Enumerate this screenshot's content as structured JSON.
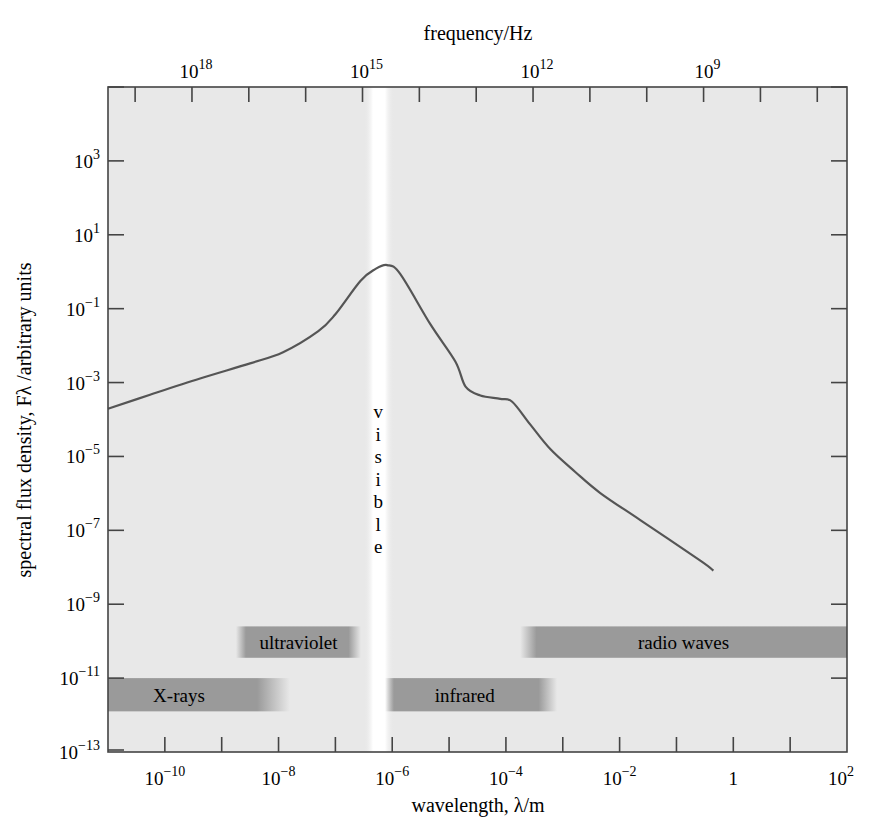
{
  "chart_data": {
    "type": "line",
    "title": "",
    "xlabel": "wavelength, λ/m",
    "ylabel": "spectral flux density, Fλ /arbitrary units",
    "top_xlabel": "frequency/Hz",
    "x_scale": "log",
    "y_scale": "log",
    "xlim_log10": [
      -11,
      2
    ],
    "ylim_log10": [
      -13,
      5
    ],
    "grid": false,
    "legend": null,
    "x_ticks": [
      {
        "log": -10,
        "label": "10",
        "exp": "−10"
      },
      {
        "log": -8,
        "label": "10",
        "exp": "−8"
      },
      {
        "log": -6,
        "label": "10",
        "exp": "−6"
      },
      {
        "log": -4,
        "label": "10",
        "exp": "−4"
      },
      {
        "log": -2,
        "label": "10",
        "exp": "−2"
      },
      {
        "log": 0,
        "label": "1",
        "exp": ""
      },
      {
        "log": 2,
        "label": "10",
        "exp": "2"
      }
    ],
    "y_ticks": [
      {
        "log": 3,
        "label": "10",
        "exp": "3"
      },
      {
        "log": 1,
        "label": "10",
        "exp": "1"
      },
      {
        "log": -1,
        "label": "10",
        "exp": "−1"
      },
      {
        "log": -3,
        "label": "10",
        "exp": "−3"
      },
      {
        "log": -5,
        "label": "10",
        "exp": "−5"
      },
      {
        "log": -7,
        "label": "10",
        "exp": "−7"
      },
      {
        "log": -9,
        "label": "10",
        "exp": "−9"
      },
      {
        "log": -11,
        "label": "10",
        "exp": "−11"
      },
      {
        "log": -13,
        "label": "10",
        "exp": "−13"
      }
    ],
    "freq_ticks": [
      {
        "log_hz": 18,
        "label": "10",
        "exp": "18"
      },
      {
        "log_hz": 15,
        "label": "10",
        "exp": "15"
      },
      {
        "log_hz": 12,
        "label": "10",
        "exp": "12"
      },
      {
        "log_hz": 9,
        "label": "10",
        "exp": "9"
      }
    ],
    "series": [
      {
        "name": "spectrum",
        "color": "#555555",
        "points_log10": [
          [
            -11.0,
            -3.71
          ],
          [
            -10.26,
            -3.33
          ],
          [
            -9.38,
            -2.89
          ],
          [
            -8.5,
            -2.48
          ],
          [
            -7.92,
            -2.18
          ],
          [
            -7.3,
            -1.61
          ],
          [
            -7.0,
            -1.15
          ],
          [
            -6.56,
            -0.25
          ],
          [
            -6.3,
            0.07
          ],
          [
            -6.09,
            0.18
          ],
          [
            -5.86,
            -0.06
          ],
          [
            -5.33,
            -1.42
          ],
          [
            -4.89,
            -2.43
          ],
          [
            -4.71,
            -3.11
          ],
          [
            -4.45,
            -3.35
          ],
          [
            -4.1,
            -3.44
          ],
          [
            -3.89,
            -3.52
          ],
          [
            -3.57,
            -4.14
          ],
          [
            -3.22,
            -4.8
          ],
          [
            -2.78,
            -5.42
          ],
          [
            -2.34,
            -5.99
          ],
          [
            -1.63,
            -6.73
          ],
          [
            -0.58,
            -7.82
          ],
          [
            -0.35,
            -8.09
          ]
        ]
      }
    ],
    "annotations": {
      "visible_band": {
        "label": "visible",
        "center_log10": -6.3
      },
      "bands": [
        {
          "label": "ultraviolet",
          "from_log10": -8.75,
          "to_log10": -6.55,
          "y_top_log10": -9.6,
          "y_bot_log10": -10.45
        },
        {
          "label": "radio waves",
          "from_log10": -3.75,
          "to_log10": 2,
          "y_top_log10": -9.6,
          "y_bot_log10": -10.45
        },
        {
          "label": "X-rays",
          "from_log10": -11,
          "to_log10": -7.8,
          "y_top_log10": -11,
          "y_bot_log10": -11.9
        },
        {
          "label": "infrared",
          "from_log10": -6.35,
          "to_log10": -3.1,
          "y_top_log10": -11,
          "y_bot_log10": -11.9
        }
      ]
    }
  },
  "colors": {
    "plot_bg": "#e8e8e8",
    "band_fill": "#9a9a9a",
    "curve": "#555555",
    "axis": "#444444",
    "visible_strip": "#ffffff"
  }
}
